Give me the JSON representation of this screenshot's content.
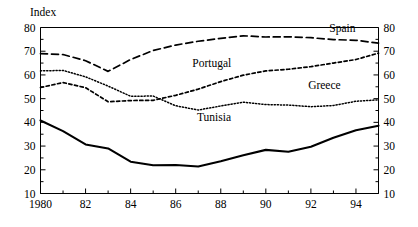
{
  "chart_data": {
    "type": "line",
    "title": "",
    "ylabel": "Index",
    "xlabel": "",
    "ylim": [
      10,
      80
    ],
    "xlim": [
      1980,
      1995
    ],
    "grid": false,
    "legend_position": "inline-annotations",
    "y_ticks": [
      80,
      70,
      60,
      50,
      40,
      30,
      20,
      10
    ],
    "y_ticks_right": [
      80,
      70,
      60,
      50,
      40,
      30,
      20,
      10
    ],
    "y_minor_ticks": [
      75,
      65,
      55,
      45,
      35,
      25,
      15
    ],
    "x_ticks": [
      1980,
      1982,
      1984,
      1986,
      1988,
      1990,
      1992,
      1994
    ],
    "x_tick_labels": [
      "1980",
      "82",
      "84",
      "86",
      "88",
      "90",
      "92",
      "94"
    ],
    "x_minor_ticks": [
      1981,
      1983,
      1985,
      1987,
      1989,
      1991,
      1993,
      1995
    ],
    "x": [
      1980,
      1981,
      1982,
      1983,
      1984,
      1985,
      1986,
      1987,
      1988,
      1989,
      1990,
      1991,
      1992,
      1993,
      1994,
      1995
    ],
    "series": [
      {
        "name": "Spain",
        "style": "long-dashed",
        "label_x": 1993.4,
        "label_y": 78.2,
        "values": [
          69.0,
          68.6,
          66.0,
          61.5,
          66.5,
          70.3,
          72.6,
          74.2,
          75.4,
          76.5,
          76.0,
          76.1,
          75.7,
          74.9,
          74.6,
          73.4
        ]
      },
      {
        "name": "Portugal",
        "style": "short-dashed",
        "label_x": 1987.6,
        "label_y": 63.5,
        "values": [
          54.7,
          56.8,
          54.6,
          48.7,
          49.2,
          49.3,
          51.4,
          54.0,
          57.2,
          59.9,
          61.7,
          62.4,
          63.5,
          65.0,
          66.5,
          69.2
        ]
      },
      {
        "name": "Greece",
        "style": "dotted",
        "label_x": 1992.6,
        "label_y": 54.0,
        "values": [
          61.7,
          61.9,
          59.2,
          55.3,
          51.0,
          51.1,
          47.0,
          45.2,
          46.9,
          48.5,
          47.5,
          47.3,
          46.6,
          47.1,
          48.9,
          49.5
        ]
      },
      {
        "name": "Tunisia",
        "style": "solid-thick",
        "label_x": 1987.7,
        "label_y": 40.5,
        "values": [
          40.8,
          36.3,
          30.7,
          29.0,
          23.4,
          21.9,
          22.0,
          21.4,
          23.6,
          26.1,
          28.4,
          27.6,
          29.7,
          33.5,
          36.7,
          38.6
        ]
      }
    ]
  }
}
